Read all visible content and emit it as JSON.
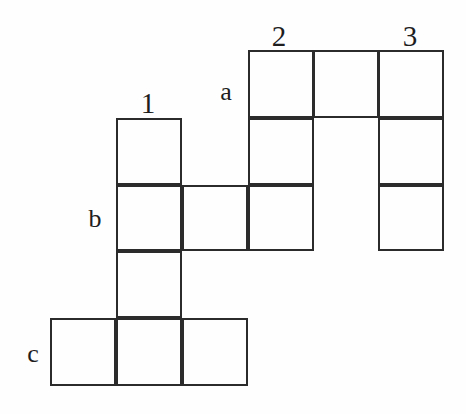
{
  "figure": {
    "type": "grid-diagram",
    "width": 466,
    "height": 414,
    "background_color": "#fefefe",
    "line_color": "#2b2b2b",
    "line_width": 2.4,
    "cell_size": 66,
    "grid_origin": {
      "x": 50,
      "y": 50
    },
    "column_x": [
      50,
      116,
      182,
      248,
      313,
      378,
      444
    ],
    "row_y": [
      50,
      118,
      185,
      251,
      318,
      386
    ]
  },
  "labels": {
    "columns": [
      {
        "text": "1",
        "name": "column-label-1",
        "x": 148,
        "y": 103
      },
      {
        "text": "2",
        "name": "column-label-2",
        "x": 279,
        "y": 36
      },
      {
        "text": "3",
        "name": "column-label-3",
        "x": 410,
        "y": 36
      }
    ],
    "rows": [
      {
        "text": "a",
        "name": "row-label-a",
        "x": 226,
        "y": 92
      },
      {
        "text": "b",
        "name": "row-label-b",
        "x": 95,
        "y": 219
      },
      {
        "text": "c",
        "name": "row-label-c",
        "x": 33,
        "y": 354
      }
    ]
  },
  "cells": [
    {
      "name": "cell-a-c4",
      "row": "a",
      "col": 4,
      "x": 248,
      "y": 50,
      "w": 66,
      "h": 68
    },
    {
      "name": "cell-a-c5",
      "row": "a",
      "col": 5,
      "x": 313,
      "y": 50,
      "w": 66,
      "h": 68
    },
    {
      "name": "cell-a-c6",
      "row": "a",
      "col": 6,
      "x": 378,
      "y": 50,
      "w": 66,
      "h": 68
    },
    {
      "name": "cell-r2-c2",
      "row": "r2",
      "col": 2,
      "x": 116,
      "y": 118,
      "w": 66,
      "h": 67
    },
    {
      "name": "cell-r2-c4",
      "row": "r2",
      "col": 4,
      "x": 248,
      "y": 118,
      "w": 66,
      "h": 67
    },
    {
      "name": "cell-r2-c6",
      "row": "r2",
      "col": 6,
      "x": 378,
      "y": 118,
      "w": 66,
      "h": 67
    },
    {
      "name": "cell-b-c2",
      "row": "b",
      "col": 2,
      "x": 116,
      "y": 185,
      "w": 66,
      "h": 66
    },
    {
      "name": "cell-b-c3",
      "row": "b",
      "col": 3,
      "x": 182,
      "y": 185,
      "w": 66,
      "h": 66
    },
    {
      "name": "cell-b-c4",
      "row": "b",
      "col": 4,
      "x": 248,
      "y": 185,
      "w": 66,
      "h": 66
    },
    {
      "name": "cell-b-c6",
      "row": "b",
      "col": 6,
      "x": 378,
      "y": 185,
      "w": 66,
      "h": 66
    },
    {
      "name": "cell-r4-c2",
      "row": "r4",
      "col": 2,
      "x": 116,
      "y": 251,
      "w": 66,
      "h": 67
    },
    {
      "name": "cell-c-c1",
      "row": "c",
      "col": 1,
      "x": 50,
      "y": 318,
      "w": 66,
      "h": 68
    },
    {
      "name": "cell-c-c2",
      "row": "c",
      "col": 2,
      "x": 116,
      "y": 318,
      "w": 66,
      "h": 68
    },
    {
      "name": "cell-c-c3",
      "row": "c",
      "col": 3,
      "x": 182,
      "y": 318,
      "w": 66,
      "h": 68
    }
  ]
}
